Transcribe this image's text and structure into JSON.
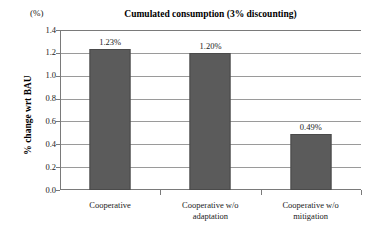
{
  "chart_data": {
    "type": "bar",
    "title": "Cumulated consumption (3% discounting)",
    "unit_label": "(%)",
    "xlabel": "",
    "ylabel": "% change wrt BAU",
    "categories": [
      "Cooperative",
      "Cooperative w/o adaptation",
      "Cooperative w/o mitigation"
    ],
    "category_lines": [
      [
        "Cooperative"
      ],
      [
        "Cooperative w/o",
        "adaptation"
      ],
      [
        "Cooperative w/o",
        "mitigation"
      ]
    ],
    "values": [
      1.23,
      1.2,
      0.49
    ],
    "data_labels": [
      "1.23%",
      "1.20%",
      "0.49%"
    ],
    "ylim": [
      0.0,
      1.4
    ],
    "ytick_values": [
      1.4,
      1.2,
      1.0,
      0.8,
      0.6,
      0.4,
      0.2,
      0.0
    ],
    "ytick_labels": [
      "1.4",
      "1.2",
      "1.0",
      "0.8",
      "0.6",
      "0.4",
      "0.2",
      "0.0"
    ],
    "grid": true,
    "legend": false,
    "bar_color": "#5b5b5b",
    "grid_color": "#9a9a9a",
    "axis_color": "#7a7a7a",
    "background": "#ffffff"
  }
}
